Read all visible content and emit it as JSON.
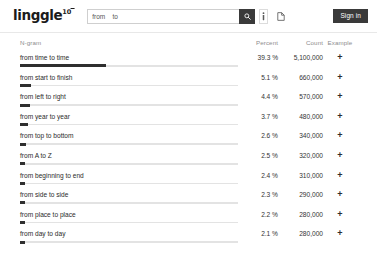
{
  "header": {
    "logo_text": "linggle",
    "logo_superscript": "10",
    "search": {
      "value": "from _ to _",
      "placeholder": "from _ to _"
    },
    "search_button_icon": "search-icon",
    "info_button_icon": "info-icon",
    "document_button_icon": "document-icon",
    "signin_label": "Sign in"
  },
  "table": {
    "columns": {
      "ngram": "N-gram",
      "percent": "Percent",
      "count": "Count",
      "example": "Example"
    },
    "example_icon": "plus-icon",
    "rows": [
      {
        "ngram": "from time to time",
        "percent": "39.3 %",
        "count": "5,100,000"
      },
      {
        "ngram": "from start to finish",
        "percent": "5.1 %",
        "count": "660,000"
      },
      {
        "ngram": "from left to right",
        "percent": "4.4 %",
        "count": "570,000"
      },
      {
        "ngram": "from year to year",
        "percent": "3.7 %",
        "count": "480,000"
      },
      {
        "ngram": "from top to bottom",
        "percent": "2.6 %",
        "count": "340,000"
      },
      {
        "ngram": "from A to Z",
        "percent": "2.5 %",
        "count": "320,000"
      },
      {
        "ngram": "from beginning to end",
        "percent": "2.4 %",
        "count": "310,000"
      },
      {
        "ngram": "from side to side",
        "percent": "2.3 %",
        "count": "290,000"
      },
      {
        "ngram": "from place to place",
        "percent": "2.2 %",
        "count": "280,000"
      },
      {
        "ngram": "from day to day",
        "percent": "2.1 %",
        "count": "280,000"
      }
    ]
  },
  "chart_data": {
    "type": "bar",
    "title": "",
    "xlabel": "Percent",
    "ylabel": "N-gram",
    "categories": [
      "from time to time",
      "from start to finish",
      "from left to right",
      "from year to year",
      "from top to bottom",
      "from A to Z",
      "from beginning to end",
      "from side to side",
      "from place to place",
      "from day to day"
    ],
    "values": [
      39.3,
      5.1,
      4.4,
      3.7,
      2.6,
      2.5,
      2.4,
      2.3,
      2.2,
      2.1
    ],
    "counts": [
      5100000,
      660000,
      570000,
      480000,
      340000,
      320000,
      310000,
      290000,
      280000,
      280000
    ],
    "xlim": [
      0,
      100
    ],
    "grid": false,
    "legend": "none"
  },
  "colors": {
    "bar_fill": "#2f2f2f",
    "bar_track": "#e3e3e3",
    "accent_dark": "#3a3a3a",
    "text": "#2b2b2b",
    "muted": "#8d8d8d"
  }
}
